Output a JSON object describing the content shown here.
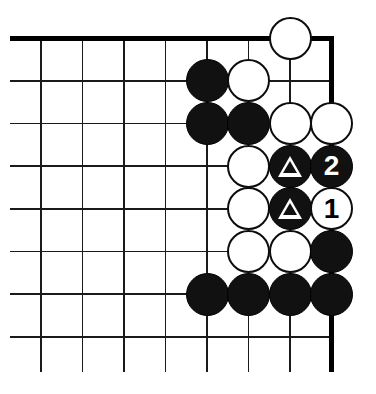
{
  "diagram": {
    "kind": "go-board-diagram",
    "board": {
      "columns": 8,
      "rows": 8,
      "origin_x": 41,
      "origin_y": 38,
      "spacing_x": 41.5,
      "spacing_y": 42.7,
      "stone_diameter": 43,
      "line_color": "#1a1a1a",
      "edge_color": "#000000",
      "background_color": "#ffffff",
      "thin_line_width": 1.6,
      "edge_line_width": 5,
      "top_edge": true,
      "right_edge": true,
      "left_open": true,
      "bottom_open": true,
      "top_edge_from_x": 10,
      "top_edge_to_x": 334,
      "right_edge_from_y": 36,
      "right_edge_to_y": 372,
      "thin_line_left_x": 10,
      "thin_line_bottom_y": 372
    },
    "colors": {
      "black_stone": "#111111",
      "white_stone": "#ffffff",
      "stone_outline": "#0d0d0d",
      "black_label_text": "#ffffff",
      "white_label_text": "#000000",
      "triangle_mark": "#ffffff"
    },
    "stones": [
      {
        "name": "stone-white-g8",
        "col": 6,
        "row": 0,
        "color": "white",
        "label": "",
        "mark": ""
      },
      {
        "name": "stone-black-e7",
        "col": 4,
        "row": 1,
        "color": "black",
        "label": "",
        "mark": ""
      },
      {
        "name": "stone-white-f7",
        "col": 5,
        "row": 1,
        "color": "white",
        "label": "",
        "mark": ""
      },
      {
        "name": "stone-black-e6",
        "col": 4,
        "row": 2,
        "color": "black",
        "label": "",
        "mark": ""
      },
      {
        "name": "stone-black-f6",
        "col": 5,
        "row": 2,
        "color": "black",
        "label": "",
        "mark": ""
      },
      {
        "name": "stone-white-g6",
        "col": 6,
        "row": 2,
        "color": "white",
        "label": "",
        "mark": ""
      },
      {
        "name": "stone-white-h6",
        "col": 7,
        "row": 2,
        "color": "white",
        "label": "",
        "mark": ""
      },
      {
        "name": "stone-white-f5",
        "col": 5,
        "row": 3,
        "color": "white",
        "label": "",
        "mark": ""
      },
      {
        "name": "stone-black-g5-triangle",
        "col": 6,
        "row": 3,
        "color": "black",
        "label": "",
        "mark": "triangle"
      },
      {
        "name": "stone-black-h5-move-2",
        "col": 7,
        "row": 3,
        "color": "black",
        "label": "2",
        "mark": ""
      },
      {
        "name": "stone-white-f4",
        "col": 5,
        "row": 4,
        "color": "white",
        "label": "",
        "mark": ""
      },
      {
        "name": "stone-black-g4-triangle",
        "col": 6,
        "row": 4,
        "color": "black",
        "label": "",
        "mark": "triangle"
      },
      {
        "name": "stone-white-h4-move-1",
        "col": 7,
        "row": 4,
        "color": "white",
        "label": "1",
        "mark": ""
      },
      {
        "name": "stone-white-f3",
        "col": 5,
        "row": 5,
        "color": "white",
        "label": "",
        "mark": ""
      },
      {
        "name": "stone-white-g3",
        "col": 6,
        "row": 5,
        "color": "white",
        "label": "",
        "mark": ""
      },
      {
        "name": "stone-black-h3",
        "col": 7,
        "row": 5,
        "color": "black",
        "label": "",
        "mark": ""
      },
      {
        "name": "stone-black-e2",
        "col": 4,
        "row": 6,
        "color": "black",
        "label": "",
        "mark": ""
      },
      {
        "name": "stone-black-f2",
        "col": 5,
        "row": 6,
        "color": "black",
        "label": "",
        "mark": ""
      },
      {
        "name": "stone-black-g2",
        "col": 6,
        "row": 6,
        "color": "black",
        "label": "",
        "mark": ""
      },
      {
        "name": "stone-black-h2",
        "col": 7,
        "row": 6,
        "color": "black",
        "label": "",
        "mark": ""
      }
    ],
    "move_labels": [
      "1",
      "2"
    ],
    "marked_stone_count": 2
  }
}
